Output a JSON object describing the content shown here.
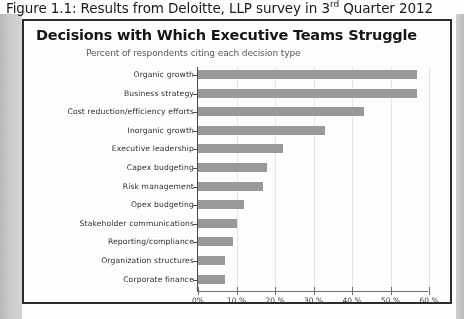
{
  "figure": {
    "caption_prefix": "Figure 1.1:  Results from Deloitte, LLP survey in 3",
    "caption_superscript": "rd",
    "caption_suffix": " Quarter 2012"
  },
  "chart_data": {
    "type": "bar",
    "orientation": "horizontal",
    "title": "Decisions with Which Executive Teams Struggle",
    "subtitle": "Percent of respondents citing each decision type",
    "xlabel": "",
    "ylabel": "",
    "xlim": [
      0,
      60
    ],
    "grid": true,
    "legend": "none",
    "bar_color": "#9a9a9a",
    "xtick_labels": [
      "0%",
      "10 %",
      "20 %",
      "30 %",
      "40 %",
      "50 %",
      "60 %"
    ],
    "xtick_values": [
      0,
      10,
      20,
      30,
      40,
      50,
      60
    ],
    "categories": [
      "Organic growth",
      "Business strategy",
      "Cost reduction/efficiency efforts",
      "Inorganic growth",
      "Executive leadership",
      "Capex budgeting",
      "Risk management",
      "Opex budgeting",
      "Stakeholder communications",
      "Reporting/compliance",
      "Organization structures",
      "Corporate finance"
    ],
    "values": [
      57,
      57,
      43,
      33,
      22,
      18,
      17,
      12,
      10,
      9,
      7,
      7
    ]
  }
}
